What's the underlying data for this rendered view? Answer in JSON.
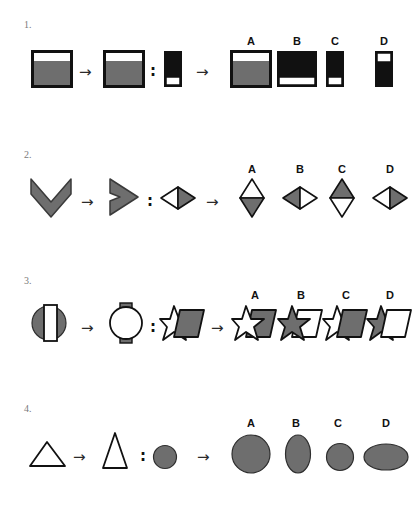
{
  "page": {
    "background": "#ffffff",
    "ink": "#111111",
    "gray_fill": "#6e6e6e",
    "black_fill": "#111111",
    "white_fill": "#ffffff",
    "arrow_glyph": "→",
    "colon_glyph": ":"
  },
  "option_labels": [
    "A",
    "B",
    "C",
    "D"
  ],
  "problems": [
    {
      "number": "1.",
      "prompt": {
        "first": {
          "name": "square-white-top-gray-body",
          "description": "Square with thin white band across the top and gray fill below"
        },
        "second": {
          "name": "square-white-top-gray-body-same",
          "description": "Square with thin white band across the top and gray fill below"
        },
        "third": {
          "name": "tall-black-rectangle-white-bottom",
          "description": "Narrow tall black rectangle with white band at the bottom"
        }
      },
      "options": [
        {
          "label": "A",
          "name": "option-square-white-top-gray-body",
          "description": "Square, white band on top, gray fill below"
        },
        {
          "label": "B",
          "name": "option-square-black-white-bottom",
          "description": "Square, black fill with white band at the bottom"
        },
        {
          "label": "C",
          "name": "option-tall-black-white-bottom",
          "description": "Narrow tall black rectangle with white band at the bottom"
        },
        {
          "label": "D",
          "name": "option-tall-white-top-black-body",
          "description": "Narrow tall rectangle, white band on top, black fill below"
        }
      ]
    },
    {
      "number": "2.",
      "prompt": {
        "first": {
          "name": "gray-chevron-pointing-down",
          "description": "Gray chevron arrow pointing down"
        },
        "second": {
          "name": "gray-chevron-pointing-right",
          "description": "Gray chevron arrow pointing right"
        },
        "third": {
          "name": "wide-diamond-white-left-gray-right",
          "description": "Wide diamond, left half white, right half gray"
        }
      },
      "options": [
        {
          "label": "A",
          "name": "option-tall-diamond-white-top-gray-bottom",
          "description": "Tall diamond, top half white, bottom half gray"
        },
        {
          "label": "B",
          "name": "option-wide-diamond-gray-left-white-right",
          "description": "Wide diamond, left half gray, right half white"
        },
        {
          "label": "C",
          "name": "option-tall-diamond-gray-top-white-bottom",
          "description": "Tall diamond, top half gray, bottom half white"
        },
        {
          "label": "D",
          "name": "option-wide-diamond-white-left-gray-right",
          "description": "Wide diamond, left half white, right half gray"
        }
      ]
    },
    {
      "number": "3.",
      "prompt": {
        "first": {
          "name": "gray-circle-with-white-vertical-bar",
          "description": "Gray circle overlapped by an upright white rectangle bar"
        },
        "second": {
          "name": "white-circle-with-gray-tabs",
          "description": "White circle with small gray tabs at top and bottom"
        },
        "third": {
          "name": "white-star-behind-gray-parallelogram",
          "description": "White star with gray parallelogram overlapping its right side"
        }
      },
      "options": [
        {
          "label": "A",
          "name": "option-white-star-front-gray-parallelogram-back",
          "description": "White star in front, gray parallelogram behind on the right"
        },
        {
          "label": "B",
          "name": "option-gray-star-front-white-parallelogram-back",
          "description": "Gray star in front, white parallelogram behind on the right"
        },
        {
          "label": "C",
          "name": "option-gray-parallelogram-front-white-star-back",
          "description": "Gray parallelogram in front, white star behind on the left"
        },
        {
          "label": "D",
          "name": "option-white-parallelogram-front-gray-star-back",
          "description": "White parallelogram in front, gray star behind on the left"
        }
      ]
    },
    {
      "number": "4.",
      "prompt": {
        "first": {
          "name": "wide-white-triangle",
          "description": "Wide outlined white triangle"
        },
        "second": {
          "name": "tall-white-triangle",
          "description": "Tall narrow outlined white triangle"
        },
        "third": {
          "name": "small-gray-circle",
          "description": "Small gray circle"
        }
      },
      "options": [
        {
          "label": "A",
          "name": "option-large-gray-circle",
          "description": "Large gray circle"
        },
        {
          "label": "B",
          "name": "option-tall-gray-ellipse",
          "description": "Tall gray ellipse"
        },
        {
          "label": "C",
          "name": "option-small-gray-circle",
          "description": "Small gray circle"
        },
        {
          "label": "D",
          "name": "option-wide-gray-ellipse",
          "description": "Wide gray ellipse"
        }
      ]
    }
  ]
}
